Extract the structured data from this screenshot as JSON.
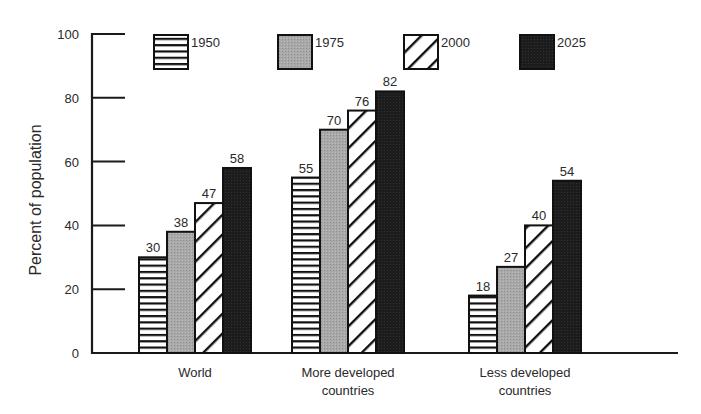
{
  "chart_data": {
    "type": "bar",
    "title": "",
    "xlabel": "",
    "ylabel": "Percent of population",
    "ylim": [
      0,
      100
    ],
    "yticks": [
      0,
      20,
      40,
      60,
      80,
      100
    ],
    "categories": [
      "World",
      "More developed countries",
      "Less developed countries"
    ],
    "category_labels": [
      [
        "World"
      ],
      [
        "More developed",
        "countries"
      ],
      [
        "Less developed",
        "countries"
      ]
    ],
    "series": [
      {
        "name": "1950",
        "pattern": "horizontal-stripes",
        "values": [
          30,
          55,
          18
        ]
      },
      {
        "name": "1975",
        "pattern": "gray-fill",
        "values": [
          38,
          70,
          27
        ]
      },
      {
        "name": "2000",
        "pattern": "diagonal-hatch",
        "values": [
          47,
          76,
          40
        ]
      },
      {
        "name": "2025",
        "pattern": "black-fill",
        "values": [
          58,
          82,
          54
        ]
      }
    ],
    "data_labels": true,
    "legend_position": "top",
    "grid": false
  },
  "colors": {
    "axis": "#1a1a1a",
    "gray_fill": "#a8a8a8",
    "dark_fill": "#1e1e1e",
    "stroke": "#111111"
  }
}
